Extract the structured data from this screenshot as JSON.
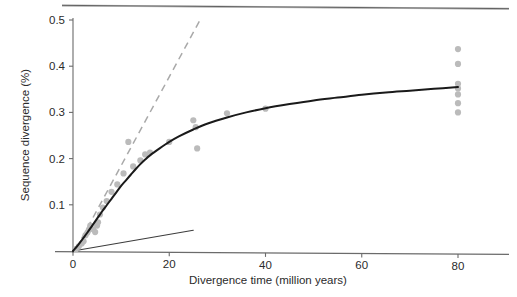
{
  "chart_data": {
    "type": "scatter",
    "title": "",
    "xlabel": "Divergence time (million years)",
    "ylabel": "Sequence divergence (%)",
    "xlim": [
      0,
      88
    ],
    "ylim": [
      0,
      0.5
    ],
    "xticks": [
      0,
      20,
      40,
      60,
      80
    ],
    "xtick_labels": [
      "0",
      "20",
      "40",
      "60",
      "80"
    ],
    "yticks": [
      0.1,
      0.2,
      0.3,
      0.4,
      0.5
    ],
    "ytick_labels": [
      "0.1",
      "0.2",
      "0.3",
      "0.4",
      "0.5"
    ],
    "grid": false,
    "legend": "none",
    "point_color": "#bbbbbb",
    "curve_color": "#1a1a1a",
    "dashed_line_color": "#a9a9a9",
    "straight_line_color": "#3c3c3c",
    "axis_color": "#6b6b6b",
    "series": [
      {
        "name": "Observed pairwise comparisons",
        "type": "scatter",
        "marker": "filled-circle",
        "color": "#bbbbbb",
        "points": [
          [
            0.6,
            0.004
          ],
          [
            1.2,
            0.01
          ],
          [
            1.8,
            0.016
          ],
          [
            2.2,
            0.021
          ],
          [
            2.6,
            0.034
          ],
          [
            3.0,
            0.04
          ],
          [
            3.3,
            0.046
          ],
          [
            3.6,
            0.055
          ],
          [
            4.2,
            0.047
          ],
          [
            4.6,
            0.041
          ],
          [
            5.0,
            0.055
          ],
          [
            5.2,
            0.062
          ],
          [
            5.6,
            0.079
          ],
          [
            6.2,
            0.094
          ],
          [
            7.0,
            0.108
          ],
          [
            8.0,
            0.128
          ],
          [
            9.2,
            0.144
          ],
          [
            10.5,
            0.168
          ],
          [
            11.5,
            0.236
          ],
          [
            12.5,
            0.183
          ],
          [
            14.0,
            0.196
          ],
          [
            15.0,
            0.209
          ],
          [
            16.0,
            0.213
          ],
          [
            20.0,
            0.236
          ],
          [
            25.0,
            0.283
          ],
          [
            25.5,
            0.268
          ],
          [
            25.8,
            0.222
          ],
          [
            32.0,
            0.298
          ],
          [
            40.0,
            0.308
          ],
          [
            80.0,
            0.437
          ],
          [
            80.0,
            0.405
          ],
          [
            80.0,
            0.362
          ],
          [
            80.0,
            0.352
          ],
          [
            80.0,
            0.339
          ],
          [
            80.0,
            0.32
          ],
          [
            80.0,
            0.3
          ]
        ]
      },
      {
        "name": "Saturating fitted curve",
        "type": "line",
        "style": "solid",
        "color": "#1a1a1a",
        "points": [
          [
            0.0,
            0.0
          ],
          [
            1.0,
            0.012
          ],
          [
            2.0,
            0.026
          ],
          [
            3.0,
            0.04
          ],
          [
            4.0,
            0.055
          ],
          [
            5.0,
            0.07
          ],
          [
            6.0,
            0.085
          ],
          [
            7.0,
            0.099
          ],
          [
            8.0,
            0.113
          ],
          [
            9.0,
            0.127
          ],
          [
            10.0,
            0.141
          ],
          [
            11.0,
            0.153
          ],
          [
            12.0,
            0.165
          ],
          [
            13.0,
            0.177
          ],
          [
            14.0,
            0.188
          ],
          [
            15.0,
            0.198
          ],
          [
            16.0,
            0.207
          ],
          [
            18.0,
            0.222
          ],
          [
            20.0,
            0.236
          ],
          [
            22.0,
            0.248
          ],
          [
            25.0,
            0.263
          ],
          [
            28.0,
            0.276
          ],
          [
            32.0,
            0.289
          ],
          [
            36.0,
            0.3
          ],
          [
            40.0,
            0.309
          ],
          [
            45.0,
            0.318
          ],
          [
            50.0,
            0.326
          ],
          [
            55.0,
            0.332
          ],
          [
            60.0,
            0.338
          ],
          [
            65.0,
            0.343
          ],
          [
            70.0,
            0.347
          ],
          [
            75.0,
            0.351
          ],
          [
            80.0,
            0.355
          ]
        ]
      },
      {
        "name": "Initial-rate extrapolation (dashed)",
        "type": "line",
        "style": "dashed",
        "color": "#a9a9a9",
        "points": [
          [
            0.6,
            0.004
          ],
          [
            26.4,
            0.5
          ]
        ]
      },
      {
        "name": "Low-rate reference line",
        "type": "line",
        "style": "solid-thin",
        "color": "#3c3c3c",
        "points": [
          [
            0.0,
            0.0
          ],
          [
            25.0,
            0.045
          ]
        ]
      }
    ]
  },
  "axes": {
    "x_title": "Divergence time (million years)",
    "y_title": "Sequence divergence (%)"
  }
}
